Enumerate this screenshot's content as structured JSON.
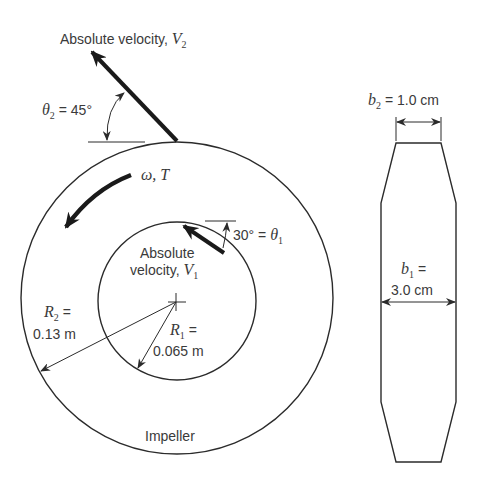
{
  "diagram": {
    "colors": {
      "line": "#2b2b2b",
      "text": "#3a3a3a",
      "background": "#ffffff"
    },
    "outlet_velocity": {
      "label_main": "Absolute velocity, ",
      "symbol": "V",
      "subscript": "2",
      "angle_symbol": "θ",
      "angle_subscript": "2",
      "angle_value": " = 45°"
    },
    "rotation": {
      "label": "ω, T"
    },
    "inlet_velocity": {
      "label_line1": "Absolute",
      "label_line2": "velocity, ",
      "symbol": "V",
      "subscript": "1",
      "angle_value": "30° = ",
      "angle_symbol": "θ",
      "angle_subscript": "1"
    },
    "outer_radius": {
      "symbol": "R",
      "subscript": "2",
      "equals": " =",
      "value": "0.13 m"
    },
    "inner_radius": {
      "symbol": "R",
      "subscript": "1",
      "equals": " =",
      "value": "0.065 m"
    },
    "impeller_label": "Impeller",
    "outlet_width": {
      "symbol": "b",
      "subscript": "2",
      "value": " = 1.0 cm"
    },
    "inlet_width": {
      "symbol": "b",
      "subscript": "1",
      "equals": " =",
      "value": "3.0 cm"
    }
  }
}
